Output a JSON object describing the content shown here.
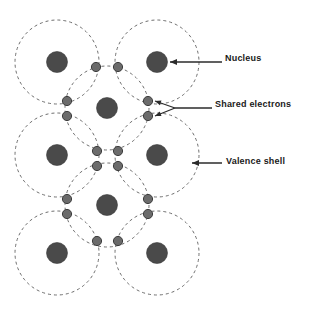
{
  "figure": {
    "background_color": "#ffffff",
    "nucleus_color": "#4a4a4a",
    "electron_color": "#6b6b6b",
    "shell_color": "#6e6e6e",
    "leader_color": "#2b2b2b"
  },
  "labels": [
    {
      "id": "nucleus",
      "text": "Nucleus",
      "x": 225,
      "y": 54
    },
    {
      "id": "shared-electrons",
      "text": "Shared electrons",
      "x": 215,
      "y": 100
    },
    {
      "id": "valence-shell",
      "text": "Valence shell",
      "x": 226,
      "y": 157
    }
  ],
  "diagram_data": {
    "type": "diagram",
    "subject": "Covalent bond lattice (silicon-like crystal structure)",
    "shell_radius": 42,
    "nucleus_radius": 10.5,
    "electron_radius": 4.6,
    "atoms": [
      {
        "id": "atom-top-left",
        "cx": 57,
        "cy": 62
      },
      {
        "id": "atom-top-right",
        "cx": 157,
        "cy": 62
      },
      {
        "id": "atom-center-upper",
        "cx": 107,
        "cy": 108
      },
      {
        "id": "atom-middle-left",
        "cx": 57,
        "cy": 155
      },
      {
        "id": "atom-middle-right",
        "cx": 157,
        "cy": 155
      },
      {
        "id": "atom-center-lower",
        "cx": 107,
        "cy": 205
      },
      {
        "id": "atom-bottom-left",
        "cx": 57,
        "cy": 253
      },
      {
        "id": "atom-bottom-right",
        "cx": 157,
        "cy": 253
      }
    ],
    "electron_pairs": [
      {
        "id": "pair-top",
        "a": {
          "x": 96,
          "y": 67
        },
        "b": {
          "x": 118,
          "y": 67
        }
      },
      {
        "id": "pair-upper-left",
        "a": {
          "x": 67,
          "y": 101
        },
        "b": {
          "x": 67,
          "y": 116
        }
      },
      {
        "id": "pair-upper-right",
        "a": {
          "x": 148,
          "y": 101
        },
        "b": {
          "x": 148,
          "y": 116
        }
      },
      {
        "id": "pair-middle-upper",
        "a": {
          "x": 97,
          "y": 151
        },
        "b": {
          "x": 118,
          "y": 151
        }
      },
      {
        "id": "pair-middle-lower",
        "a": {
          "x": 97,
          "y": 166
        },
        "b": {
          "x": 118,
          "y": 166
        }
      },
      {
        "id": "pair-lower-left",
        "a": {
          "x": 67,
          "y": 199
        },
        "b": {
          "x": 67,
          "y": 214
        }
      },
      {
        "id": "pair-lower-right",
        "a": {
          "x": 148,
          "y": 199
        },
        "b": {
          "x": 148,
          "y": 214
        }
      },
      {
        "id": "pair-bottom",
        "a": {
          "x": 97,
          "y": 241
        },
        "b": {
          "x": 118,
          "y": 241
        }
      }
    ],
    "leaders": [
      {
        "id": "leader-nucleus",
        "label": "Nucleus",
        "from": {
          "x": 222,
          "y": 62
        },
        "to": {
          "x": 170,
          "y": 62
        },
        "style": "single-arrow"
      },
      {
        "id": "leader-shared-electrons",
        "label": "Shared electrons",
        "from": {
          "x": 212,
          "y": 108
        },
        "to": {
          "x": 175,
          "y": 108
        },
        "fork_targets": [
          {
            "x": 155,
            "y": 101
          },
          {
            "x": 155,
            "y": 116
          }
        ],
        "style": "forked-double-arrow"
      },
      {
        "id": "leader-valence-shell",
        "label": "Valence shell",
        "from": {
          "x": 222,
          "y": 163
        },
        "to": {
          "x": 192,
          "y": 163
        },
        "style": "single-arrow"
      }
    ]
  }
}
